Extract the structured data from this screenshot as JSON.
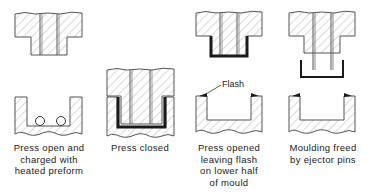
{
  "diagram": {
    "colors": {
      "outline": "#555555",
      "hatch": "#9a9a9a",
      "moulding": "#1a1a1a",
      "text": "#222222"
    },
    "stages": [
      {
        "id": "stage-1",
        "caption": "Press open and\ncharged with\nheated preform"
      },
      {
        "id": "stage-2",
        "caption": "Press closed"
      },
      {
        "id": "stage-3",
        "caption": "Press opened\nleaving flash\non lower half\nof mould",
        "annotation": "Flash"
      },
      {
        "id": "stage-4",
        "caption": "Moulding freed\nby ejector pins"
      }
    ]
  }
}
